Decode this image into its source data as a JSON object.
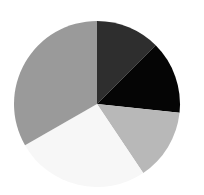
{
  "chart_data": {
    "type": "pie",
    "title": "",
    "start_angle_deg_from_top": 0,
    "direction": "clockwise",
    "legend": "none",
    "labels_visible": false,
    "slices": [
      {
        "name": "slice-1",
        "value": 12.5,
        "color": "#2e2e2e"
      },
      {
        "name": "slice-2",
        "value": 14.2,
        "color": "#050505"
      },
      {
        "name": "slice-3",
        "value": 13.9,
        "color": "#b8b8b8"
      },
      {
        "name": "slice-4",
        "value": 26.1,
        "color": "#f7f7f7"
      },
      {
        "name": "slice-5",
        "value": 33.3,
        "color": "#9a9a9a"
      }
    ]
  }
}
